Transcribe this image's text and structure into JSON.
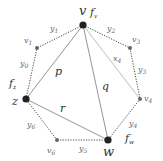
{
  "diagram": {
    "type": "graph",
    "nodes": [
      {
        "id": "v",
        "label": "v",
        "x": 83,
        "y": 25,
        "major": true
      },
      {
        "id": "v1",
        "label": "v",
        "sub": "1",
        "x": 37,
        "y": 48,
        "major": false
      },
      {
        "id": "v3",
        "label": "v",
        "sub": "3",
        "x": 130,
        "y": 48,
        "major": false
      },
      {
        "id": "z",
        "label": "z",
        "x": 26,
        "y": 99,
        "major": true
      },
      {
        "id": "v4",
        "label": "v",
        "sub": "4",
        "x": 140,
        "y": 99,
        "major": false
      },
      {
        "id": "v6",
        "label": "v",
        "sub": "6",
        "x": 57,
        "y": 140,
        "major": false
      },
      {
        "id": "w",
        "label": "w",
        "x": 108,
        "y": 140,
        "major": true
      }
    ],
    "face_labels": [
      {
        "id": "fv",
        "label": "f",
        "sub": "v"
      },
      {
        "id": "fz",
        "label": "f",
        "sub": "z"
      },
      {
        "id": "fw",
        "label": "f",
        "sub": "w"
      }
    ],
    "edges": [
      {
        "from": "v",
        "to": "v1",
        "label": "y",
        "sub": "1",
        "style": "dotted"
      },
      {
        "from": "v",
        "to": "v3",
        "label": "y",
        "sub": "2",
        "style": "dotted"
      },
      {
        "from": "v3",
        "to": "v4",
        "label": "y",
        "sub": "3",
        "style": "dotted"
      },
      {
        "from": "v4",
        "to": "w",
        "label": "y",
        "sub": "4",
        "style": "dotted"
      },
      {
        "from": "w",
        "to": "v6",
        "label": "y",
        "sub": "5",
        "style": "dotted"
      },
      {
        "from": "v6",
        "to": "z",
        "label": "y",
        "sub": "6",
        "style": "dotted"
      },
      {
        "from": "z",
        "to": "v1",
        "label": "y",
        "sub": "0",
        "style": "dotted"
      },
      {
        "from": "v",
        "to": "z",
        "label": "p",
        "style": "solid"
      },
      {
        "from": "v",
        "to": "w",
        "label": "q",
        "style": "solid"
      },
      {
        "from": "z",
        "to": "w",
        "label": "r",
        "style": "solid"
      },
      {
        "from": "v",
        "to": "v4",
        "label": "x",
        "sub": "4",
        "style": "light"
      }
    ]
  },
  "labels": {
    "v": "v",
    "z": "z",
    "w": "w",
    "v1": "v",
    "v1_sub": "1",
    "v3": "v",
    "v3_sub": "3",
    "v4": "v",
    "v4_sub": "4",
    "v6": "v",
    "v6_sub": "6",
    "fv": "f",
    "fv_sub": "v",
    "fz": "f",
    "fz_sub": "z",
    "fw": "f",
    "fw_sub": "w",
    "y0": "y",
    "y0_sub": "0",
    "y1": "y",
    "y1_sub": "1",
    "y2": "y",
    "y2_sub": "2",
    "y3": "y",
    "y3_sub": "3",
    "y4": "y",
    "y4_sub": "4",
    "y5": "y",
    "y5_sub": "5",
    "y6": "y",
    "y6_sub": "6",
    "x4": "x",
    "x4_sub": "4",
    "p": "p",
    "q": "q",
    "r": "r"
  },
  "colors": {
    "dotted_edge": "#333333",
    "solid_edge": "#888888",
    "light_edge": "#c8c8c8",
    "major_node": "#222222",
    "minor_node": "#666666"
  }
}
